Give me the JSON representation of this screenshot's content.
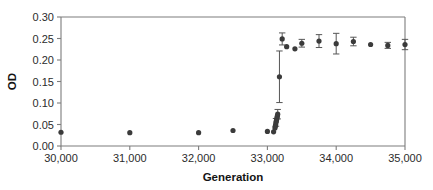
{
  "chart_data": {
    "type": "scatter",
    "title": "",
    "xlabel": "Generation",
    "ylabel": "OD",
    "xlim": [
      30000,
      35000
    ],
    "ylim": [
      0.0,
      0.3
    ],
    "xticks": [
      30000,
      31000,
      32000,
      33000,
      34000,
      35000
    ],
    "xtick_labels": [
      "30,000",
      "31,000",
      "32,000",
      "33,000",
      "34,000",
      "35,000"
    ],
    "yticks": [
      0.0,
      0.05,
      0.1,
      0.15,
      0.2,
      0.25,
      0.3
    ],
    "ytick_labels": [
      "0.00",
      "0.05",
      "0.10",
      "0.15",
      "0.20",
      "0.25",
      "0.30"
    ],
    "grid": false,
    "legend": null,
    "marker_color": "#3b3b3b",
    "errorbar_color": "#565656",
    "axis_color": "#7d7d7d",
    "series": [
      {
        "name": "OD vs Generation",
        "points": [
          {
            "x": 30000,
            "y": 0.032,
            "yerr": 0.0
          },
          {
            "x": 31000,
            "y": 0.031,
            "yerr": 0.0
          },
          {
            "x": 32000,
            "y": 0.031,
            "yerr": 0.0
          },
          {
            "x": 32500,
            "y": 0.036,
            "yerr": 0.0
          },
          {
            "x": 33000,
            "y": 0.034,
            "yerr": 0.0
          },
          {
            "x": 33090,
            "y": 0.033,
            "yerr": 0.0
          },
          {
            "x": 33110,
            "y": 0.042,
            "yerr": 0.0
          },
          {
            "x": 33115,
            "y": 0.046,
            "yerr": 0.0
          },
          {
            "x": 33120,
            "y": 0.05,
            "yerr": 0.0
          },
          {
            "x": 33125,
            "y": 0.055,
            "yerr": 0.009
          },
          {
            "x": 33130,
            "y": 0.058,
            "yerr": 0.0
          },
          {
            "x": 33135,
            "y": 0.062,
            "yerr": 0.0
          },
          {
            "x": 33140,
            "y": 0.066,
            "yerr": 0.0
          },
          {
            "x": 33145,
            "y": 0.07,
            "yerr": 0.0
          },
          {
            "x": 33150,
            "y": 0.074,
            "yerr": 0.011
          },
          {
            "x": 33175,
            "y": 0.161,
            "yerr": 0.06
          },
          {
            "x": 33215,
            "y": 0.249,
            "yerr": 0.014
          },
          {
            "x": 33280,
            "y": 0.231,
            "yerr": 0.0
          },
          {
            "x": 33400,
            "y": 0.226,
            "yerr": 0.0
          },
          {
            "x": 33500,
            "y": 0.239,
            "yerr": 0.009
          },
          {
            "x": 33750,
            "y": 0.244,
            "yerr": 0.015
          },
          {
            "x": 34000,
            "y": 0.238,
            "yerr": 0.024
          },
          {
            "x": 34250,
            "y": 0.243,
            "yerr": 0.01
          },
          {
            "x": 34500,
            "y": 0.236,
            "yerr": 0.0
          },
          {
            "x": 34750,
            "y": 0.234,
            "yerr": 0.007
          },
          {
            "x": 35000,
            "y": 0.236,
            "yerr": 0.012
          }
        ]
      }
    ]
  }
}
